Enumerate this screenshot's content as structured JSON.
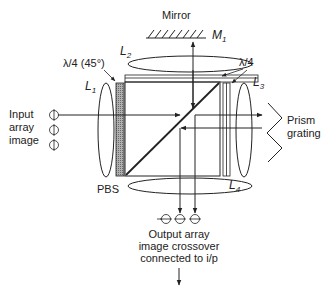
{
  "diagram": {
    "type": "optical-system-schematic",
    "labels": {
      "mirror": "Mirror",
      "m1_main": "M",
      "m1_sub": "1",
      "l1_main": "L",
      "l1_sub": "1",
      "l2_main": "L",
      "l2_sub": "2",
      "l3_main": "L",
      "l3_sub": "3",
      "l4_main": "L",
      "l4_sub": "4",
      "qwp45": "λ/4 (45°)",
      "qwp": "λ/4",
      "pbs": "PBS",
      "input_line1": "Input",
      "input_line2": "array",
      "input_line3": "image",
      "prism_line1": "Prism",
      "prism_line2": "grating",
      "output_line1": "Output array",
      "output_line2": "image crossover",
      "output_line3": "connected to i/p"
    },
    "components": [
      {
        "id": "M1",
        "kind": "mirror"
      },
      {
        "id": "L1",
        "kind": "lens"
      },
      {
        "id": "L2",
        "kind": "lens"
      },
      {
        "id": "L3",
        "kind": "lens"
      },
      {
        "id": "L4",
        "kind": "lens"
      },
      {
        "id": "PBS",
        "kind": "polarizing-beam-splitter"
      },
      {
        "id": "QWP45",
        "kind": "quarter-wave-plate-45deg"
      },
      {
        "id": "QWP-top",
        "kind": "quarter-wave-plate"
      },
      {
        "id": "QWP-right",
        "kind": "quarter-wave-plate"
      },
      {
        "id": "prism-grating",
        "kind": "prism-grating"
      }
    ],
    "colors": {
      "ink": "#222222",
      "shaded_plate": "#9a9a9a"
    }
  }
}
